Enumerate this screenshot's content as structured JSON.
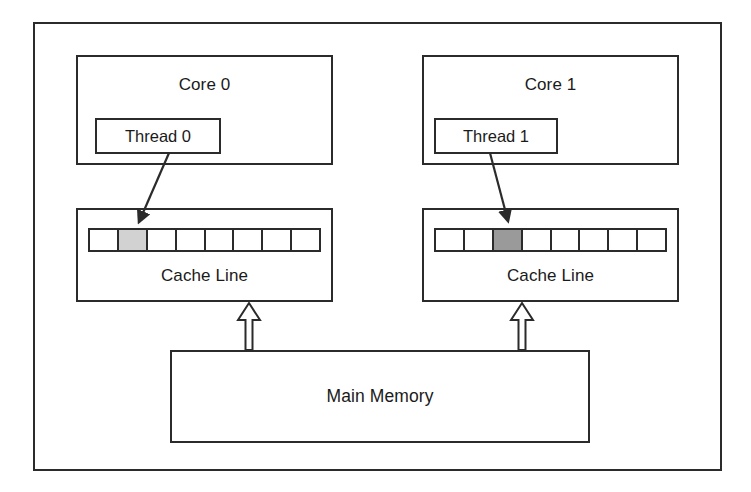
{
  "diagram": {
    "frame": {
      "border_color": "#2b2b2b"
    }
  },
  "cores": [
    {
      "label": "Core 0",
      "thread": {
        "label": "Thread 0"
      }
    },
    {
      "label": "Core 1",
      "thread": {
        "label": "Thread 1"
      }
    }
  ],
  "caches": [
    {
      "label": "Cache Line",
      "cell_count": 8,
      "highlighted_index": 1,
      "highlight_color": "#d2d2d2"
    },
    {
      "label": "Cache Line",
      "cell_count": 8,
      "highlighted_index": 2,
      "highlight_color": "#9a9a9a"
    }
  ],
  "memory": {
    "label": "Main Memory"
  },
  "arrows": {
    "thread_to_cache": [
      {
        "name": "thread-0-to-cache-0",
        "style": "solid-filled-head"
      },
      {
        "name": "thread-1-to-cache-1",
        "style": "solid-filled-head"
      }
    ],
    "memory_to_cache": [
      {
        "name": "memory-to-cache-0",
        "style": "hollow-block-arrow"
      },
      {
        "name": "memory-to-cache-1",
        "style": "hollow-block-arrow"
      }
    ]
  },
  "colors": {
    "stroke": "#2b2b2b",
    "background": "#ffffff",
    "cell_empty": "#ffffff"
  }
}
